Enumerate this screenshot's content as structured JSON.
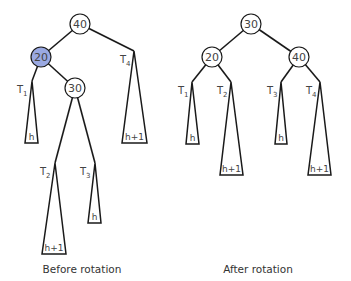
{
  "diagram": {
    "before": {
      "caption": "Before rotation",
      "nodes": [
        {
          "id": "n40",
          "label": "40",
          "highlighted": false
        },
        {
          "id": "n20",
          "label": "20",
          "highlighted": true
        },
        {
          "id": "n30",
          "label": "30",
          "highlighted": false
        }
      ],
      "subtrees": [
        {
          "name": "T",
          "sub": "1",
          "height": "h"
        },
        {
          "name": "T",
          "sub": "2",
          "height": "h+1"
        },
        {
          "name": "T",
          "sub": "3",
          "height": "h"
        },
        {
          "name": "T",
          "sub": "4",
          "height": "h+1"
        }
      ]
    },
    "after": {
      "caption": "After rotation",
      "nodes": [
        {
          "id": "n30",
          "label": "30",
          "highlighted": false
        },
        {
          "id": "n20",
          "label": "20",
          "highlighted": false
        },
        {
          "id": "n40",
          "label": "40",
          "highlighted": false
        }
      ],
      "subtrees": [
        {
          "name": "T",
          "sub": "1",
          "height": "h"
        },
        {
          "name": "T",
          "sub": "2",
          "height": "h+1"
        },
        {
          "name": "T",
          "sub": "3",
          "height": "h"
        },
        {
          "name": "T",
          "sub": "4",
          "height": "h+1"
        }
      ]
    },
    "colors": {
      "highlight": "#9aa9e2",
      "stroke": "#1a1a1a",
      "text": "#444444"
    }
  }
}
